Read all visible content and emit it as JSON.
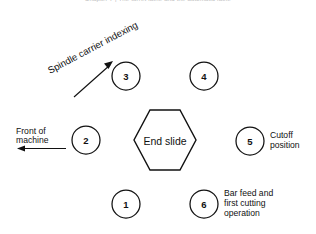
{
  "page": {
    "width": 316,
    "height": 234,
    "background": "#ffffff",
    "ink_color": "#111111",
    "running_head": "Chapter 7  |  The turret lathe and the automatic lathe"
  },
  "figure": {
    "center_label": "End slide",
    "center_shape": "hexagon",
    "stations": [
      {
        "number": "1",
        "cx": 126,
        "cy": 204,
        "r": 14,
        "label": ""
      },
      {
        "number": "2",
        "cx": 86,
        "cy": 140,
        "r": 14,
        "label": ""
      },
      {
        "number": "3",
        "cx": 126,
        "cy": 76,
        "r": 14,
        "label": ""
      },
      {
        "number": "4",
        "cx": 204,
        "cy": 76,
        "r": 14,
        "label": ""
      },
      {
        "number": "5",
        "cx": 250,
        "cy": 141,
        "r": 14,
        "label": "Cutoff position"
      },
      {
        "number": "6",
        "cx": 204,
        "cy": 204,
        "r": 14,
        "label": "Bar feed and first cutting operation"
      }
    ],
    "callouts": [
      {
        "name": "spindle-carrier-indexing",
        "lines": [
          "Spindle carrier indexing"
        ],
        "rotation_deg": -28,
        "x": 50,
        "y": 72
      },
      {
        "name": "front-of-machine",
        "lines": [
          "Front  of",
          "machine"
        ],
        "x": 16,
        "y": 132,
        "arrow_direction": "left"
      },
      {
        "name": "cutoff-position",
        "lines": [
          "Cutoff",
          "position"
        ],
        "x": 272,
        "y": 136
      },
      {
        "name": "bar-feed-and-first-cutting-operation",
        "lines": [
          "Bar feed and",
          "first cutting",
          "operation"
        ],
        "x": 226,
        "y": 194
      }
    ],
    "arrows": [
      {
        "name": "indexing-arrow",
        "from_x": 74,
        "from_y": 97,
        "to_x": 112,
        "to_y": 63
      },
      {
        "name": "front-of-machine-arrow",
        "from_x": 66,
        "from_y": 148,
        "to_x": 18,
        "to_y": 148
      }
    ]
  }
}
